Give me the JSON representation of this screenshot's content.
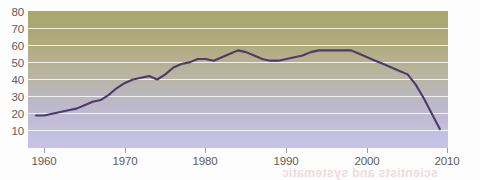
{
  "chart_data": {
    "type": "line",
    "title": "",
    "subtitle": "",
    "xlabel": "",
    "ylabel": "",
    "xlim": [
      1958,
      2010
    ],
    "ylim": [
      0,
      80
    ],
    "grid": true,
    "legend": "none",
    "y_ticks": [
      80,
      70,
      60,
      50,
      40,
      30,
      20,
      10
    ],
    "x_ticks": [
      1960,
      1970,
      1980,
      1990,
      2000,
      2010
    ],
    "series": [
      {
        "name": "value",
        "color": "#4d3a6e",
        "x": [
          1959,
          1960,
          1961,
          1962,
          1963,
          1964,
          1965,
          1966,
          1967,
          1968,
          1969,
          1970,
          1971,
          1972,
          1973,
          1974,
          1975,
          1976,
          1977,
          1978,
          1979,
          1980,
          1981,
          1982,
          1983,
          1984,
          1985,
          1986,
          1987,
          1988,
          1989,
          1990,
          1991,
          1992,
          1993,
          1994,
          1995,
          1996,
          1997,
          1998,
          1999,
          2000,
          2001,
          2002,
          2003,
          2004,
          2005,
          2006,
          2007,
          2008,
          2009
        ],
        "values": [
          19,
          19,
          20,
          21,
          22,
          23,
          25,
          27,
          28,
          31,
          35,
          38,
          40,
          41,
          42,
          40,
          43,
          47,
          49,
          50,
          52,
          52,
          51,
          53,
          55,
          57,
          56,
          54,
          52,
          51,
          51,
          52,
          53,
          54,
          56,
          57,
          57,
          57,
          57,
          57,
          55,
          53,
          51,
          49,
          47,
          45,
          43,
          37,
          29,
          20,
          11
        ]
      }
    ]
  },
  "axes": {
    "y_labels": [
      "80",
      "70",
      "60",
      "50",
      "40",
      "30",
      "20",
      "10"
    ],
    "x_labels": [
      "1960",
      "1970",
      "1980",
      "1990",
      "2000",
      "2010"
    ]
  },
  "colors": {
    "line": "#4d3a6e",
    "gradient_top": "#a8a86c",
    "gradient_bottom": "#c6c3e6",
    "gridline": "#ffffff",
    "tick_text": "#5c5c5c",
    "page_background": "#ffffff"
  },
  "artifacts": {
    "bleed_through_text": "scientists and systematic"
  }
}
